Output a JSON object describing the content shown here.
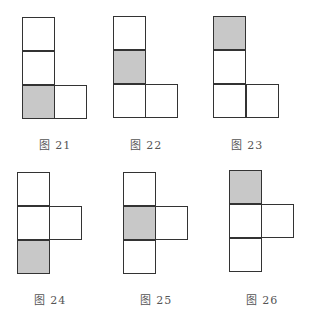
{
  "figures": [
    {
      "id": "fig21",
      "label": "图 21",
      "shaded_row": 3,
      "arm_row": 3
    },
    {
      "id": "fig22",
      "label": "图 22",
      "shaded_row": 2,
      "arm_row": 3
    },
    {
      "id": "fig23",
      "label": "图 23",
      "shaded_row": 1,
      "arm_row": 3
    },
    {
      "id": "fig24",
      "label": "图 24",
      "shaded_row": 3,
      "arm_row": 2
    },
    {
      "id": "fig25",
      "label": "图 25",
      "shaded_row": 2,
      "arm_row": 2
    },
    {
      "id": "fig26",
      "label": "图 26",
      "shaded_row": 1,
      "arm_row": 2
    }
  ],
  "colors": {
    "shade": "#c8c8c8",
    "stroke": "#333333"
  }
}
